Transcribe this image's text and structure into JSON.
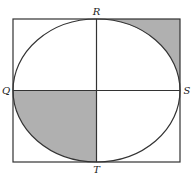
{
  "diagram": {
    "type": "geometry",
    "colors": {
      "stroke": "#333333",
      "shading": "#b0b0b0",
      "background": "#ffffff"
    },
    "rectangle": {
      "x": 13,
      "y": 19,
      "width": 167,
      "height": 143
    },
    "ellipse": {
      "cx": 96.5,
      "cy": 90.5,
      "rx": 83.5,
      "ry": 71.5
    },
    "points": [
      {
        "name": "R",
        "label": "R",
        "position": "top"
      },
      {
        "name": "Q",
        "label": "Q",
        "position": "left"
      },
      {
        "name": "S",
        "label": "S",
        "position": "right"
      },
      {
        "name": "T",
        "label": "T",
        "position": "bottom"
      }
    ],
    "shaded_regions": [
      {
        "name": "top-right-corner",
        "description": "Region between ellipse arc RS and the rectangle's top-right corner"
      },
      {
        "name": "bottom-left-quarter-ellipse",
        "description": "Quarter of ellipse bounded by Q, center, and T"
      }
    ]
  }
}
